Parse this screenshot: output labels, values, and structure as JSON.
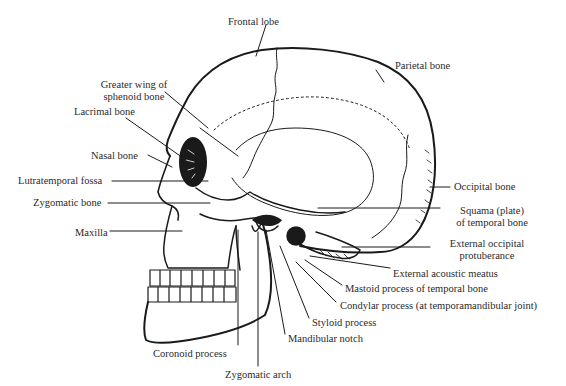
{
  "diagram": {
    "type": "anatomical-illustration",
    "labels": [
      {
        "id": "frontal-lobe",
        "text": "Frontal lobe",
        "x": 228,
        "y": 16,
        "align": "left"
      },
      {
        "id": "parietal-bone",
        "text": "Parietal bone",
        "x": 395,
        "y": 60,
        "align": "left"
      },
      {
        "id": "greater-wing-sphenoid",
        "text": "Greater wing of\nsphenoid bone",
        "x": 88,
        "y": 79,
        "align": "center",
        "w": 92
      },
      {
        "id": "lacrimal-bone",
        "text": "Lacrimal bone",
        "x": 74,
        "y": 106,
        "align": "left"
      },
      {
        "id": "nasal-bone",
        "text": "Nasal bone",
        "x": 91,
        "y": 150,
        "align": "left"
      },
      {
        "id": "lutratemporal-fossa",
        "text": "Lutratemporal fossa",
        "x": 18,
        "y": 175,
        "align": "left"
      },
      {
        "id": "zygomatic-bone",
        "text": "Zygomatic bone",
        "x": 33,
        "y": 197,
        "align": "left"
      },
      {
        "id": "maxilla",
        "text": "Maxilla",
        "x": 75,
        "y": 227,
        "align": "left"
      },
      {
        "id": "occipital-bone",
        "text": "Occipital bone",
        "x": 454,
        "y": 181,
        "align": "left"
      },
      {
        "id": "squama-temporal",
        "text": "Squama (plate)\nof temporal bone",
        "x": 444,
        "y": 205,
        "align": "center",
        "w": 96
      },
      {
        "id": "external-occipital-protuberance",
        "text": "External occipital\nprotuberance",
        "x": 434,
        "y": 238,
        "align": "center",
        "w": 106
      },
      {
        "id": "external-acoustic-meatus",
        "text": "External acoustic meatus",
        "x": 393,
        "y": 268,
        "align": "left"
      },
      {
        "id": "mastoid-process",
        "text": "Mastoid process of temporal bone",
        "x": 345,
        "y": 283,
        "align": "left"
      },
      {
        "id": "condylar-process",
        "text": "Condylar process (at temporamandibular joint)",
        "x": 340,
        "y": 300,
        "align": "left"
      },
      {
        "id": "styloid-process",
        "text": "Styloid process",
        "x": 312,
        "y": 317,
        "align": "left"
      },
      {
        "id": "mandibular-notch",
        "text": "Mandibular notch",
        "x": 288,
        "y": 333,
        "align": "left"
      },
      {
        "id": "coronoid-process",
        "text": "Coronoid process",
        "x": 153,
        "y": 348,
        "align": "left"
      },
      {
        "id": "zygomatic-arch",
        "text": "Zygomatic arch",
        "x": 225,
        "y": 369,
        "align": "left"
      }
    ],
    "colors": {
      "ink": "#1a1a1a",
      "background": "#ffffff",
      "text": "#2a2a2a"
    }
  }
}
